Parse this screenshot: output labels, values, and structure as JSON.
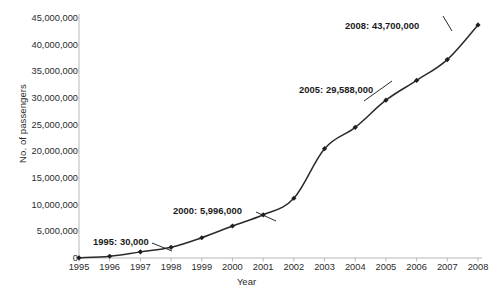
{
  "chart_data": {
    "type": "line",
    "title": "",
    "xlabel": "Year",
    "ylabel": "No. of passengers",
    "categories": [
      1995,
      1996,
      1997,
      1998,
      1999,
      2000,
      2001,
      2002,
      2003,
      2004,
      2005,
      2006,
      2007,
      2008
    ],
    "x_tick_labels": [
      "1995",
      "1996",
      "1997",
      "1998",
      "1999",
      "2000",
      "2001",
      "2002",
      "2003",
      "2004",
      "2005",
      "2006",
      "2007",
      "2008"
    ],
    "values": [
      30000,
      330000,
      1150000,
      2000000,
      3800000,
      5996000,
      8100000,
      11200000,
      20500000,
      24500000,
      29588000,
      33300000,
      37200000,
      43700000
    ],
    "y_tick_values": [
      0,
      5000000,
      10000000,
      15000000,
      20000000,
      25000000,
      30000000,
      35000000,
      40000000,
      45000000
    ],
    "y_tick_labels": [
      "0",
      "5,000,000",
      "10,000,000",
      "15,000,000",
      "20,000,000",
      "25,000,000",
      "30,000,000",
      "35,000,000",
      "40,000,000",
      "45,000,000"
    ],
    "ylim": [
      0,
      45000000
    ],
    "xlim": [
      1995,
      2008
    ],
    "grid": false,
    "legend": false,
    "line_color": "#2a2a2a",
    "marker": "diamond",
    "axis_color": "#b8b8b8",
    "annotations": [
      {
        "label": "1995: 30,000",
        "year": 1995,
        "value": 30000
      },
      {
        "label": "2000: 5,996,000",
        "year": 2000,
        "value": 5996000
      },
      {
        "label": "2005: 29,588,000",
        "year": 2005,
        "value": 29588000
      },
      {
        "label": "2008: 43,700,000",
        "year": 2008,
        "value": 43700000
      }
    ]
  },
  "annotation_positions": [
    {
      "text_x": 93,
      "text_y": 236,
      "lx1": 152,
      "ly1": 243,
      "lx2": 172,
      "ly2": 251
    },
    {
      "text_x": 173,
      "text_y": 205,
      "lx1": 256,
      "ly1": 212,
      "lx2": 276,
      "ly2": 221
    },
    {
      "text_x": 299,
      "text_y": 84,
      "lx1": 392,
      "ly1": 81,
      "lx2": 364,
      "ly2": 101
    },
    {
      "text_x": 345,
      "text_y": 20,
      "lx1": 443,
      "ly1": 16,
      "lx2": 452,
      "ly2": 31
    }
  ],
  "footer": {
    "caption": ""
  }
}
